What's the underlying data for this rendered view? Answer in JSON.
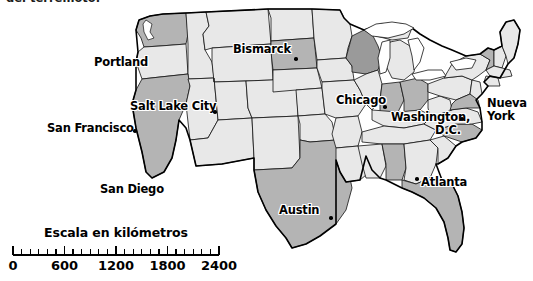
{
  "caption": {
    "clipped_line": "del terremoto."
  },
  "map": {
    "title": "Mapa de los Estados Unidos",
    "background_color": "#ffffff",
    "state_fill_light": "#e8e8e8",
    "state_fill_medium": "#b4b4b4",
    "state_fill_dark": "#9a9a9a",
    "border_color": "#111111",
    "outline_color": "#000000"
  },
  "cities": [
    {
      "name": "Portland",
      "label_x": 94,
      "label_y": 56,
      "dot_x": 150,
      "dot_y": 68,
      "lines": [
        "Portland"
      ],
      "dot_visible": false
    },
    {
      "name": "Bismarck",
      "label_x": 233,
      "label_y": 43,
      "dot_x": 294,
      "dot_y": 57,
      "lines": [
        "Bismarck"
      ],
      "dot_visible": true
    },
    {
      "name": "Salt Lake City",
      "label_x": 130,
      "label_y": 100,
      "dot_x": 213,
      "dot_y": 110,
      "lines": [
        "Salt Lake City"
      ],
      "dot_visible": true
    },
    {
      "name": "Chicago",
      "label_x": 336,
      "label_y": 94,
      "dot_x": 383,
      "dot_y": 105,
      "lines": [
        "Chicago"
      ],
      "dot_visible": true
    },
    {
      "name": "San Francisco",
      "label_x": 47,
      "label_y": 122,
      "dot_x": 133,
      "dot_y": 129,
      "lines": [
        "San Francisco"
      ],
      "dot_visible": true
    },
    {
      "name": "Washington, D.C.",
      "label_x": 391,
      "label_y": 111,
      "dot_x": 458,
      "dot_y": 118,
      "lines": [
        "Washington,",
        "D.C."
      ],
      "dot_visible": true
    },
    {
      "name": "Nueva York",
      "label_x": 487,
      "label_y": 97,
      "dot_x": 484,
      "dot_y": 110,
      "lines": [
        "Nueva",
        "York"
      ],
      "dot_visible": false
    },
    {
      "name": "San Diego",
      "label_x": 100,
      "label_y": 183,
      "dot_x": 168,
      "dot_y": 190,
      "lines": [
        "San Diego"
      ],
      "dot_visible": false
    },
    {
      "name": "Atlanta",
      "label_x": 419,
      "label_y": 176,
      "dot_x": 415,
      "dot_y": 177,
      "lines": [
        "Atlanta"
      ],
      "dot_visible": true
    },
    {
      "name": "Austin",
      "label_x": 279,
      "label_y": 204,
      "dot_x": 329,
      "dot_y": 216,
      "lines": [
        "Austin"
      ],
      "dot_visible": true
    }
  ],
  "scale": {
    "title": "Escala en kilómetros",
    "unit": "kilómetros",
    "tick_labels": [
      "0",
      "600",
      "1200",
      "1800",
      "2400"
    ],
    "tick_values": [
      0,
      600,
      1200,
      1800,
      2400
    ],
    "minor_per_major": 6,
    "bar_start_x": 13,
    "bar_end_x": 219,
    "max_value": 2400
  }
}
